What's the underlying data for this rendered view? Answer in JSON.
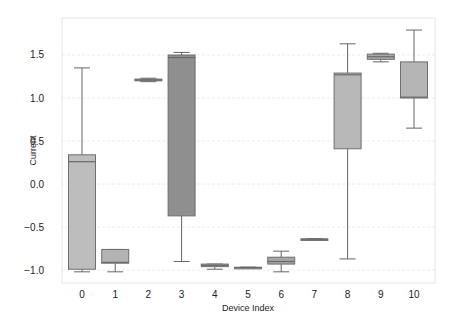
{
  "chart_data": {
    "type": "box",
    "title": "",
    "xlabel": "Device Index",
    "ylabel": "Current",
    "ylim": [
      -1.15,
      1.93
    ],
    "yticks": [
      -1.0,
      -0.5,
      0.0,
      0.5,
      1.0,
      1.5
    ],
    "ytick_labels": [
      "−1.0",
      "−0.5",
      "0.0",
      "0.5",
      "1.0",
      "1.5"
    ],
    "grid": true,
    "categories": [
      "0",
      "1",
      "2",
      "3",
      "4",
      "5",
      "6",
      "7",
      "8",
      "9",
      "10"
    ],
    "boxes": [
      {
        "label": "0",
        "whislo": -1.02,
        "q1": -0.99,
        "median": 0.26,
        "q3": 0.34,
        "whishi": 1.35,
        "color": "#bdbdbd"
      },
      {
        "label": "1",
        "whislo": -1.02,
        "q1": -0.92,
        "median": -0.91,
        "q3": -0.76,
        "whishi": -0.76,
        "color": "#b3b3b3"
      },
      {
        "label": "2",
        "whislo": 1.19,
        "q1": 1.2,
        "median": 1.21,
        "q3": 1.22,
        "whishi": 1.23,
        "color": "#9e9e9e"
      },
      {
        "label": "3",
        "whislo": -0.9,
        "q1": -0.37,
        "median": 1.47,
        "q3": 1.5,
        "whishi": 1.53,
        "color": "#8f8f8f"
      },
      {
        "label": "4",
        "whislo": -0.99,
        "q1": -0.96,
        "median": -0.945,
        "q3": -0.93,
        "whishi": -0.93,
        "color": "#a8a8a8"
      },
      {
        "label": "5",
        "whislo": -0.975,
        "q1": -0.972,
        "median": -0.97,
        "q3": -0.968,
        "whishi": -0.965,
        "color": "#a0a0a0"
      },
      {
        "label": "6",
        "whislo": -1.02,
        "q1": -0.93,
        "median": -0.9,
        "q3": -0.85,
        "whishi": -0.78,
        "color": "#a6a6a6"
      },
      {
        "label": "7",
        "whislo": -0.645,
        "q1": -0.642,
        "median": -0.64,
        "q3": -0.638,
        "whishi": -0.635,
        "color": "#9a9a9a"
      },
      {
        "label": "8",
        "whislo": -0.87,
        "q1": 0.41,
        "median": 1.27,
        "q3": 1.29,
        "whishi": 1.63,
        "color": "#b8b8b8"
      },
      {
        "label": "9",
        "whislo": 1.42,
        "q1": 1.45,
        "median": 1.48,
        "q3": 1.51,
        "whishi": 1.52,
        "color": "#a9a9a9"
      },
      {
        "label": "10",
        "whislo": 0.65,
        "q1": 1.0,
        "median": 1.01,
        "q3": 1.42,
        "whishi": 1.79,
        "color": "#b5b5b5"
      }
    ]
  }
}
